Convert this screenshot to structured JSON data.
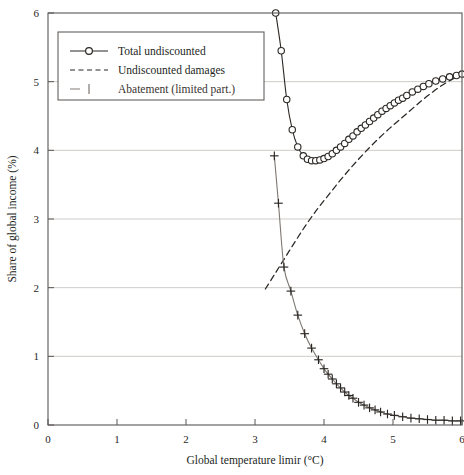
{
  "figure": {
    "background": "#ffffff",
    "frame_color": "#5a5754",
    "grid_color": "#c9c6c2",
    "curve_color": "#2b2724"
  },
  "chart_data": {
    "type": "line",
    "title": "",
    "xlabel": "Global temperature limir (°C)",
    "ylabel": "Share of global income (%)",
    "xlim": [
      0,
      6
    ],
    "ylim": [
      0,
      6
    ],
    "xticks": [
      0,
      1,
      2,
      3,
      4,
      5,
      6
    ],
    "xtick_labels": [
      "0",
      "1",
      "2",
      "3",
      "4",
      "5",
      "6"
    ],
    "yticks": [
      0,
      1,
      2,
      3,
      4,
      5,
      6
    ],
    "ytick_labels": [
      "0",
      "1",
      "2",
      "3",
      "4",
      "5",
      "6"
    ],
    "grid": "horizontal-only",
    "gridlines_y": [
      1,
      2,
      3,
      4,
      5
    ],
    "legend_position": "upper-left",
    "series": [
      {
        "name": "Total undiscounted",
        "style": "solid-with-open-circle-markers",
        "marker": "circle-open",
        "x": [
          3.3,
          3.38,
          3.46,
          3.54,
          3.62,
          3.7,
          3.76,
          3.82,
          3.88,
          3.94,
          4.0,
          4.06,
          4.12,
          4.18,
          4.24,
          4.3,
          4.36,
          4.42,
          4.48,
          4.54,
          4.6,
          4.66,
          4.72,
          4.78,
          4.84,
          4.9,
          4.96,
          5.02,
          5.08,
          5.14,
          5.2,
          5.28,
          5.36,
          5.44,
          5.52,
          5.62,
          5.72,
          5.82,
          5.92,
          6.0
        ],
        "y": [
          6.0,
          5.45,
          4.74,
          4.3,
          4.05,
          3.92,
          3.87,
          3.85,
          3.85,
          3.86,
          3.88,
          3.91,
          3.95,
          4.0,
          4.05,
          4.1,
          4.16,
          4.21,
          4.27,
          4.32,
          4.37,
          4.42,
          4.47,
          4.52,
          4.57,
          4.61,
          4.65,
          4.69,
          4.73,
          4.76,
          4.8,
          4.85,
          4.89,
          4.93,
          4.97,
          5.01,
          5.04,
          5.07,
          5.09,
          5.11
        ]
      },
      {
        "name": "Undiscounted damages",
        "style": "dashed",
        "marker": "none",
        "x": [
          3.15,
          3.3,
          3.45,
          3.6,
          3.75,
          3.9,
          4.05,
          4.2,
          4.35,
          4.5,
          4.65,
          4.8,
          4.95,
          5.1,
          5.25,
          5.4,
          5.55,
          5.7,
          5.85,
          6.0
        ],
        "y": [
          1.98,
          2.22,
          2.46,
          2.7,
          2.93,
          3.14,
          3.33,
          3.52,
          3.7,
          3.87,
          4.03,
          4.18,
          4.32,
          4.45,
          4.58,
          4.71,
          4.83,
          4.94,
          5.03,
          5.11
        ]
      },
      {
        "name": "Abatement (limited part.)",
        "style": "solid-with-plus-markers",
        "marker": "plus",
        "x": [
          3.28,
          3.34,
          3.42,
          3.52,
          3.62,
          3.72,
          3.82,
          3.92,
          4.0,
          4.06,
          4.12,
          4.18,
          4.24,
          4.3,
          4.36,
          4.42,
          4.5,
          4.58,
          4.66,
          4.74,
          4.82,
          4.92,
          5.02,
          5.14,
          5.26,
          5.38,
          5.5,
          5.62,
          5.74,
          5.86,
          5.98
        ],
        "y": [
          3.92,
          3.23,
          2.3,
          1.95,
          1.6,
          1.33,
          1.12,
          0.95,
          0.82,
          0.74,
          0.67,
          0.6,
          0.54,
          0.48,
          0.43,
          0.39,
          0.33,
          0.29,
          0.25,
          0.22,
          0.19,
          0.16,
          0.14,
          0.12,
          0.1,
          0.09,
          0.08,
          0.07,
          0.07,
          0.06,
          0.06
        ]
      }
    ]
  },
  "legend": {
    "items": [
      {
        "label": "Total undiscounted",
        "marker": "circle-open",
        "style": "solid"
      },
      {
        "label": "Undiscounted damages",
        "marker": "none",
        "style": "dashed"
      },
      {
        "label": "Abatement (limited part.)",
        "marker": "plus",
        "style": "solid-faded"
      }
    ]
  }
}
